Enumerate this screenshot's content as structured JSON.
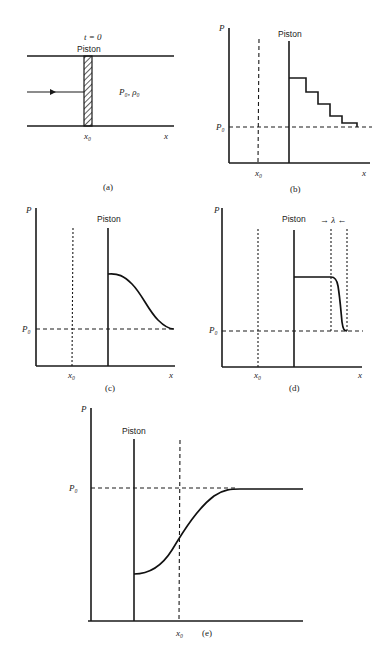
{
  "figure": {
    "panels": [
      {
        "id": "a",
        "caption": "(a)",
        "time_label": "t = 0",
        "piston_label": "Piston",
        "gas_state_label": "P₀, ρ₀",
        "x0_label": "x₀",
        "x_label": "x"
      },
      {
        "id": "b",
        "caption": "(b)",
        "y_label": "P",
        "piston_label": "Piston",
        "p0_label": "P₀",
        "x0_label": "x₀",
        "x_label": "x"
      },
      {
        "id": "c",
        "caption": "(c)",
        "y_label": "P",
        "piston_label": "Piston",
        "p0_label": "P₀",
        "x0_label": "x₀",
        "x_label": "x"
      },
      {
        "id": "d",
        "caption": "(d)",
        "y_label": "P",
        "piston_label": "Piston",
        "lambda_label": "→ λ ←",
        "p0_label": "P₀",
        "x0_label": "x₀",
        "x_label": "x"
      },
      {
        "id": "e",
        "caption": "(e)",
        "y_label": "P",
        "piston_label": "Piston",
        "p0_label": "P₀",
        "x0_label": "x₀"
      }
    ]
  },
  "colors": {
    "ink": "#1a1a1a",
    "background": "#ffffff"
  }
}
